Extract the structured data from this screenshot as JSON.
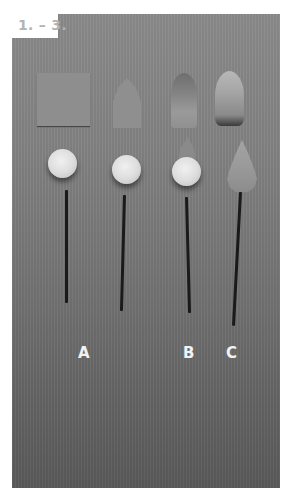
{
  "figure": {
    "step_label": "1. – 3.",
    "labels": [
      "A",
      "B",
      "C"
    ]
  },
  "colors": {
    "background": "#ffffff",
    "photo_backdrop": "#858585",
    "label_text": "#b3b3b3",
    "letter_text": "#f2f2f2"
  }
}
